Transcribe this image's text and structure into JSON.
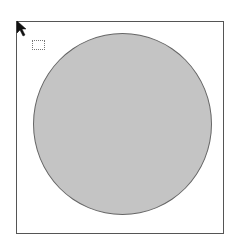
{
  "canvas": {
    "shape": "circle",
    "fill_color": "#c4c4c4",
    "stroke_color": "#666666",
    "frame_color": "#555555"
  },
  "cursor": {
    "icon": "arrow-pointer-icon"
  },
  "selection": {
    "icon": "selection-marquee-icon"
  }
}
